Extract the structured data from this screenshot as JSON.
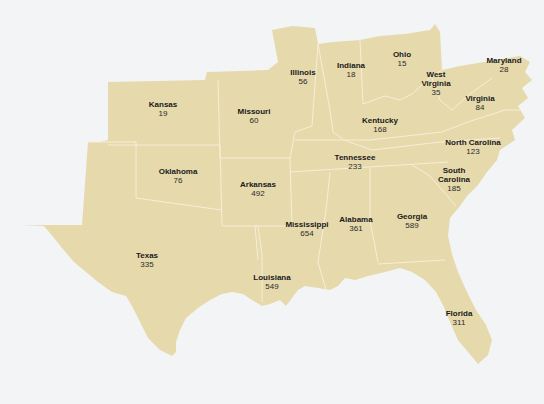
{
  "map": {
    "title": "",
    "land_color": "#e6d9ac",
    "border_color": "#f7f1dc",
    "water_color": "#f3f4f6",
    "states": [
      {
        "id": "kansas",
        "name": "Kansas",
        "value": "19",
        "x": 163,
        "y": 109
      },
      {
        "id": "missouri",
        "name": "Missouri",
        "value": "60",
        "x": 254,
        "y": 116
      },
      {
        "id": "illinois",
        "name": "Illinois",
        "value": "56",
        "x": 303,
        "y": 77
      },
      {
        "id": "indiana",
        "name": "Indiana",
        "value": "18",
        "x": 351,
        "y": 70
      },
      {
        "id": "ohio",
        "name": "Ohio",
        "value": "15",
        "x": 402,
        "y": 59
      },
      {
        "id": "maryland",
        "name": "Maryland",
        "value": "28",
        "x": 504,
        "y": 65
      },
      {
        "id": "west-virginia",
        "name": "West\nVirginia",
        "value": "35",
        "x": 436,
        "y": 88
      },
      {
        "id": "virginia",
        "name": "Virginia",
        "value": "84",
        "x": 480,
        "y": 103
      },
      {
        "id": "kentucky",
        "name": "Kentucky",
        "value": "168",
        "x": 380,
        "y": 125
      },
      {
        "id": "north-carolina",
        "name": "North Carolina",
        "value": "123",
        "x": 473,
        "y": 147
      },
      {
        "id": "tennessee",
        "name": "Tennessee",
        "value": "233",
        "x": 355,
        "y": 162
      },
      {
        "id": "oklahoma",
        "name": "Oklahoma",
        "value": "76",
        "x": 178,
        "y": 176
      },
      {
        "id": "arkansas",
        "name": "Arkansas",
        "value": "492",
        "x": 258,
        "y": 189
      },
      {
        "id": "south-carolina",
        "name": "South\nCarolina",
        "value": "185",
        "x": 454,
        "y": 184
      },
      {
        "id": "mississippi",
        "name": "Mississippi",
        "value": "654",
        "x": 307,
        "y": 229
      },
      {
        "id": "alabama",
        "name": "Alabama",
        "value": "361",
        "x": 356,
        "y": 224
      },
      {
        "id": "georgia",
        "name": "Georgia",
        "value": "589",
        "x": 412,
        "y": 221
      },
      {
        "id": "texas",
        "name": "Texas",
        "value": "335",
        "x": 147,
        "y": 260
      },
      {
        "id": "louisiana",
        "name": "Louisiana",
        "value": "549",
        "x": 272,
        "y": 282
      },
      {
        "id": "florida",
        "name": "Florida",
        "value": "311",
        "x": 459,
        "y": 318
      }
    ]
  }
}
